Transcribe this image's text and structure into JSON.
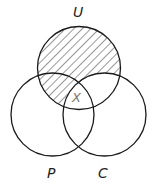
{
  "diagram": {
    "type": "venn",
    "sets": [
      {
        "label": "U",
        "cx": 79,
        "cy": 68,
        "r": 41.5
      },
      {
        "label": "P",
        "cx": 52.5,
        "cy": 114.5,
        "r": 41.5
      },
      {
        "label": "C",
        "cx": 104.5,
        "cy": 114.5,
        "r": 41.5
      }
    ],
    "center_label": "X",
    "shaded_regions": [
      "U only",
      "U ∩ P only"
    ],
    "stroke_color": "#1a1a1a",
    "hatch_color": "#333333"
  }
}
